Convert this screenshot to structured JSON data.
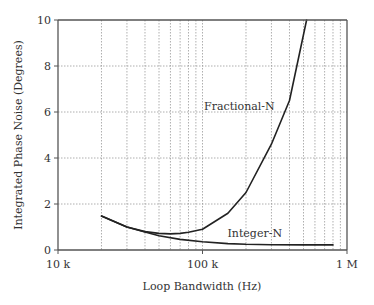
{
  "chart_data": {
    "type": "line",
    "title": "",
    "xlabel": "Loop Bandwidth (Hz)",
    "ylabel": "Integrated Phase Noise (Degrees)",
    "xscale": "log",
    "xlim": [
      10000,
      1000000
    ],
    "ylim": [
      0,
      10
    ],
    "grid": true,
    "x_ticks": [
      10000,
      100000,
      1000000
    ],
    "x_tick_labels": [
      "10 k",
      "100 k",
      "1 M"
    ],
    "y_ticks": [
      0,
      2,
      4,
      6,
      8,
      10
    ],
    "y_tick_labels": [
      "0",
      "2",
      "4",
      "6",
      "8",
      "10"
    ],
    "series": [
      {
        "name": "Fractional-N",
        "x": [
          20000,
          30000,
          40000,
          50000,
          60000,
          70000,
          80000,
          100000,
          150000,
          200000,
          300000,
          400000,
          525000
        ],
        "y": [
          1.48,
          1.0,
          0.8,
          0.72,
          0.7,
          0.72,
          0.77,
          0.9,
          1.6,
          2.5,
          4.6,
          6.5,
          10.0
        ]
      },
      {
        "name": "Integer-N",
        "x": [
          20000,
          30000,
          40000,
          50000,
          70000,
          100000,
          150000,
          200000,
          300000,
          500000,
          800000
        ],
        "y": [
          1.48,
          1.0,
          0.78,
          0.62,
          0.46,
          0.36,
          0.28,
          0.25,
          0.23,
          0.22,
          0.22
        ]
      }
    ],
    "annotations": [
      {
        "text": "Fractional-N",
        "x": 180000,
        "y": 6.1
      },
      {
        "text": "Integer-N",
        "x": 230000,
        "y": 0.55
      }
    ],
    "legend": "none"
  }
}
